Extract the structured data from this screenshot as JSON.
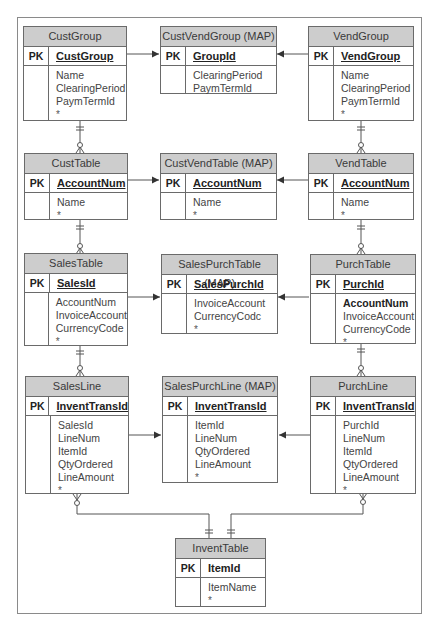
{
  "diagram": {
    "entities": {
      "cust_group": {
        "title": "CustGroup",
        "pk_label": "PK",
        "pk": "CustGroup",
        "fields": [
          "Name",
          "ClearingPeriod",
          "PaymTermId",
          "*"
        ]
      },
      "cust_vend_group": {
        "title": "CustVendGroup (MAP)",
        "pk_label": "PK",
        "pk": "GroupId",
        "fields": [
          "ClearingPeriod",
          "PaymTermId"
        ]
      },
      "vend_group": {
        "title": "VendGroup",
        "pk_label": "PK",
        "pk": "VendGroup",
        "fields": [
          "Name",
          "ClearingPeriod",
          "PaymTermId",
          "*"
        ]
      },
      "cust_table": {
        "title": "CustTable",
        "pk_label": "PK",
        "pk": "AccountNum",
        "fields": [
          "Name",
          "*"
        ]
      },
      "cust_vend_table": {
        "title": "CustVendTable (MAP)",
        "pk_label": "PK",
        "pk": "AccountNum",
        "fields": [
          "Name",
          "*"
        ]
      },
      "vend_table": {
        "title": "VendTable",
        "pk_label": "PK",
        "pk": "AccountNum",
        "fields": [
          "Name",
          "*"
        ]
      },
      "sales_table": {
        "title": "SalesTable",
        "pk_label": "PK",
        "pk": "SalesId",
        "fields": [
          "AccountNum",
          "InvoiceAccount",
          "CurrencyCode",
          "*"
        ]
      },
      "sales_purch_table": {
        "title": "SalesPurchTable (MAP)",
        "pk_label": "PK",
        "pk": "SalesPurchId",
        "fields": [
          "InvoiceAccount",
          "CurrencyCodc",
          "*"
        ]
      },
      "purch_table": {
        "title": "PurchTable",
        "pk_label": "PK",
        "pk": "PurchId",
        "fields": [
          "AccountNum",
          "InvoiceAccount",
          "CurrencyCode",
          "*"
        ]
      },
      "sales_line": {
        "title": "SalesLine",
        "pk_label": "PK",
        "pk": "InventTransId",
        "fields": [
          "SalesId",
          "LineNum",
          "ItemId",
          "QtyOrdered",
          "LineAmount",
          "*"
        ]
      },
      "sales_purch_line": {
        "title": "SalesPurchLine (MAP)",
        "pk_label": "PK",
        "pk": "InventTransId",
        "fields": [
          "ItemId",
          "LineNum",
          "QtyOrdered",
          "LineAmount",
          "*"
        ]
      },
      "purch_line": {
        "title": "PurchLine",
        "pk_label": "PK",
        "pk": "InventTransId",
        "fields": [
          "PurchId",
          "LineNum",
          "ItemId",
          "QtyOrdered",
          "LineAmount",
          "*"
        ]
      },
      "invent_table": {
        "title": "InventTable",
        "pk_label": "PK",
        "pk": "ItemId",
        "fields": [
          "ItemName",
          "*"
        ]
      }
    },
    "relationships": [
      {
        "from": "CustGroup",
        "to": "CustVendGroup (MAP)",
        "type": "map-arrow"
      },
      {
        "from": "VendGroup",
        "to": "CustVendGroup (MAP)",
        "type": "map-arrow"
      },
      {
        "from": "CustTable",
        "to": "CustVendTable (MAP)",
        "type": "map-arrow"
      },
      {
        "from": "VendTable",
        "to": "CustVendTable (MAP)",
        "type": "map-arrow"
      },
      {
        "from": "SalesTable",
        "to": "SalesPurchTable (MAP)",
        "type": "map-arrow"
      },
      {
        "from": "PurchTable",
        "to": "SalesPurchTable (MAP)",
        "type": "map-arrow"
      },
      {
        "from": "SalesLine",
        "to": "SalesPurchLine (MAP)",
        "type": "map-arrow"
      },
      {
        "from": "PurchLine",
        "to": "SalesPurchLine (MAP)",
        "type": "map-arrow"
      },
      {
        "from": "CustGroup",
        "to": "CustTable",
        "type": "one-to-zero-or-many"
      },
      {
        "from": "VendGroup",
        "to": "VendTable",
        "type": "one-to-zero-or-many"
      },
      {
        "from": "CustTable",
        "to": "SalesTable",
        "type": "one-to-zero-or-many"
      },
      {
        "from": "VendTable",
        "to": "PurchTable",
        "type": "one-to-zero-or-many"
      },
      {
        "from": "SalesTable",
        "to": "SalesLine",
        "type": "one-to-zero-or-many"
      },
      {
        "from": "PurchTable",
        "to": "PurchLine",
        "type": "one-to-zero-or-many"
      },
      {
        "from": "InventTable",
        "to": "SalesLine",
        "type": "one-to-zero-or-many"
      },
      {
        "from": "InventTable",
        "to": "PurchLine",
        "type": "one-to-zero-or-many"
      }
    ],
    "bold_fields": {
      "purch_table": [
        "AccountNum"
      ]
    },
    "colors": {
      "header_fill": "#cdcdcd",
      "border": "#6a6a6a",
      "line": "#555555"
    }
  }
}
